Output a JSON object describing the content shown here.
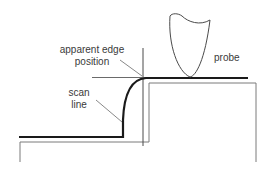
{
  "diagram": {
    "labels": {
      "apparent_edge_line1": "apparent edge",
      "apparent_edge_line2": "position",
      "probe": "probe",
      "scan_line1": "scan",
      "scan_line2": "line"
    },
    "colors": {
      "scan_line": "#1a1a1a",
      "outline": "#7a7a7a",
      "crosshair": "#4a4a4a",
      "leader": "#6a6a6a",
      "text": "#3a3a3a"
    }
  }
}
